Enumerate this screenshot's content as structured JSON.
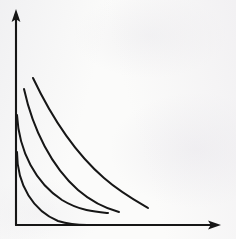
{
  "figure": {
    "background_color": "#fbfbfa",
    "ink_color": "#161616"
  },
  "chart_data": {
    "type": "line",
    "title": "",
    "xlabel": "",
    "ylabel": "",
    "xlim": [
      0,
      236
    ],
    "ylim": [
      0,
      239
    ],
    "grid": false,
    "legend": "none",
    "axes": {
      "y_axis": {
        "label": "",
        "origin": [
          16,
          225
        ],
        "end": [
          16,
          11
        ],
        "arrow": "up",
        "ticks": [],
        "tick_labels": []
      },
      "x_axis": {
        "label": "",
        "origin": [
          16,
          225
        ],
        "end": [
          220,
          225
        ],
        "arrow": "right",
        "ticks": [],
        "tick_labels": []
      }
    },
    "annotations": [],
    "series": [
      {
        "name": "curve-1-innermost",
        "shape": "concave-to-origin arc",
        "start_point": [
          17,
          152
        ],
        "end_point": [
          87,
          225
        ],
        "touches_y_axis": true,
        "touches_x_axis": true,
        "path": "M 17,152 C 17,186 34,211 58,221 C 68,224 78,225 87,225",
        "values": [
          [
            17,
            152
          ],
          [
            21,
            172
          ],
          [
            31,
            195
          ],
          [
            48,
            212
          ],
          [
            66,
            221
          ],
          [
            87,
            225
          ]
        ]
      },
      {
        "name": "curve-2",
        "shape": "concave-to-origin arc",
        "start_point": [
          17,
          115
        ],
        "end_point": [
          108,
          213
        ],
        "touches_y_axis": true,
        "touches_x_axis": false,
        "path": "M 17,115 C 19,152 36,183 62,200 C 80,211 96,212 108,213",
        "values": [
          [
            17,
            115
          ],
          [
            23,
            144
          ],
          [
            38,
            172
          ],
          [
            60,
            195
          ],
          [
            84,
            207
          ],
          [
            108,
            213
          ]
        ]
      },
      {
        "name": "curve-3",
        "shape": "concave-to-origin arc",
        "start_point": [
          24,
          89
        ],
        "end_point": [
          119,
          212
        ],
        "touches_y_axis": false,
        "touches_x_axis": false,
        "path": "M 24,89 C 33,130 52,167 78,190 C 93,203 108,209 119,212",
        "values": [
          [
            24,
            89
          ],
          [
            34,
            123
          ],
          [
            51,
            156
          ],
          [
            73,
            183
          ],
          [
            96,
            202
          ],
          [
            119,
            212
          ]
        ]
      },
      {
        "name": "curve-4-outermost",
        "shape": "concave-to-origin arc",
        "start_point": [
          33,
          78
        ],
        "end_point": [
          148,
          208
        ],
        "touches_y_axis": false,
        "touches_x_axis": false,
        "path": "M 33,78 C 51,116 74,152 104,178 C 120,192 136,201 148,208",
        "values": [
          [
            33,
            78
          ],
          [
            50,
            109
          ],
          [
            71,
            142
          ],
          [
            96,
            170
          ],
          [
            123,
            191
          ],
          [
            148,
            208
          ]
        ]
      }
    ]
  }
}
